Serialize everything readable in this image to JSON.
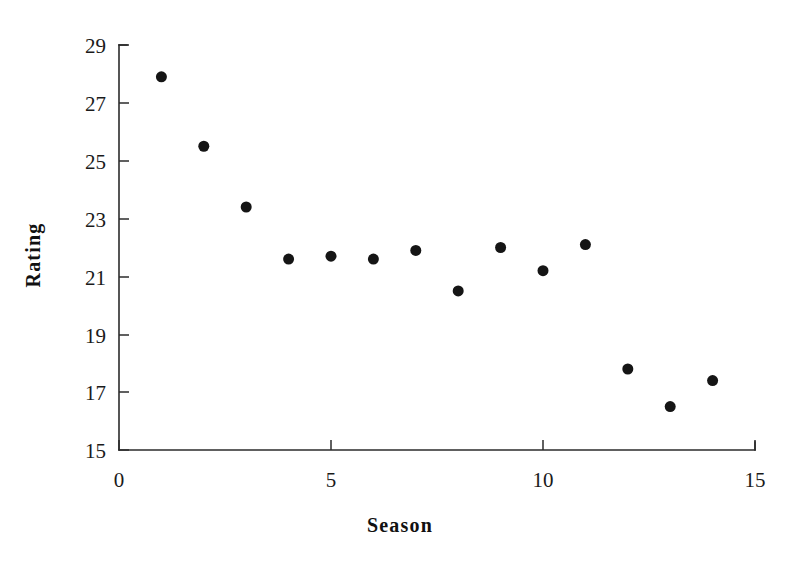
{
  "chart_data": {
    "type": "scatter",
    "title": "",
    "xlabel": "Season",
    "ylabel": "Rating",
    "xlim": [
      0,
      15
    ],
    "ylim": [
      15,
      29
    ],
    "xticks": [
      0,
      5,
      10,
      15
    ],
    "yticks": [
      15,
      17,
      19,
      21,
      23,
      25,
      27,
      29
    ],
    "xtick_labels": [
      "0",
      "5",
      "10",
      "15"
    ],
    "ytick_labels": [
      "15",
      "17",
      "19",
      "21",
      "23",
      "25",
      "27",
      "29"
    ],
    "grid": false,
    "legend": false,
    "legend_position": "none",
    "marker": "filled-circle",
    "marker_color": "#151515",
    "marker_size_px": 11,
    "x": [
      1,
      2,
      3,
      4,
      5,
      6,
      7,
      8,
      9,
      10,
      11,
      12,
      13,
      14
    ],
    "values": [
      27.9,
      25.5,
      23.4,
      21.6,
      21.7,
      21.6,
      21.9,
      20.5,
      22.0,
      21.2,
      22.1,
      17.8,
      16.5,
      17.4
    ],
    "points": [
      {
        "season": 1,
        "rating": 27.9
      },
      {
        "season": 2,
        "rating": 25.5
      },
      {
        "season": 3,
        "rating": 23.4
      },
      {
        "season": 4,
        "rating": 21.6
      },
      {
        "season": 5,
        "rating": 21.7
      },
      {
        "season": 6,
        "rating": 21.6
      },
      {
        "season": 7,
        "rating": 21.9
      },
      {
        "season": 8,
        "rating": 20.5
      },
      {
        "season": 9,
        "rating": 22.0
      },
      {
        "season": 10,
        "rating": 21.2
      },
      {
        "season": 11,
        "rating": 22.1
      },
      {
        "season": 12,
        "rating": 17.8
      },
      {
        "season": 13,
        "rating": 16.5
      },
      {
        "season": 14,
        "rating": 17.4
      }
    ]
  },
  "axes": {
    "x_axis_title": "Season",
    "y_axis_title": "Rating",
    "axis_color": "#2b2b2b",
    "background_color": "#ffffff"
  }
}
